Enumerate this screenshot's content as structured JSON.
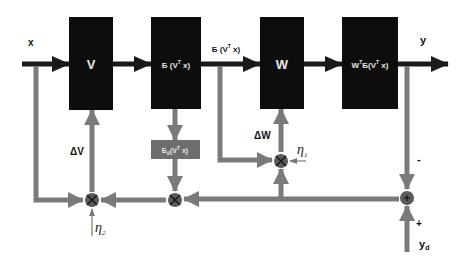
{
  "diagram": {
    "title": "",
    "colors": {
      "block": "#0d0d0d",
      "gray_block": "#6e6e6e",
      "forward_line": "#1a1a1a",
      "feedback_line": "#7a7a7a",
      "junction": "#5a5a5a"
    },
    "signals": {
      "input": "x",
      "output": "y",
      "hidden_out": "Б (V",
      "hidden_out_sup": "T",
      "hidden_out_end": " x)",
      "desired": "y",
      "desired_sub": "d",
      "delta_v": "ΔV",
      "delta_w": "ΔW",
      "eta1": "η",
      "eta1_sub": "1",
      "eta2": "η",
      "eta2_sub": "2",
      "minus": "-",
      "plus": "+"
    },
    "blocks": [
      {
        "id": "V",
        "label": "V"
      },
      {
        "id": "activation",
        "label": "Б (V",
        "sup": "T",
        "end": " x)"
      },
      {
        "id": "W",
        "label": "W"
      },
      {
        "id": "output",
        "label_a": "W",
        "sup_a": "T",
        "label_b": "Б(V",
        "sup_b": "T",
        "end": " x)"
      },
      {
        "id": "derivative",
        "label": "Б",
        "sub": "d",
        "mid": "(V",
        "sup": "T",
        "end": " x)"
      }
    ],
    "junctions": [
      {
        "id": "mult-v",
        "symbol": "×"
      },
      {
        "id": "mult-mid",
        "symbol": "×"
      },
      {
        "id": "mult-w",
        "symbol": "×"
      },
      {
        "id": "sum",
        "symbol": "+"
      }
    ]
  }
}
